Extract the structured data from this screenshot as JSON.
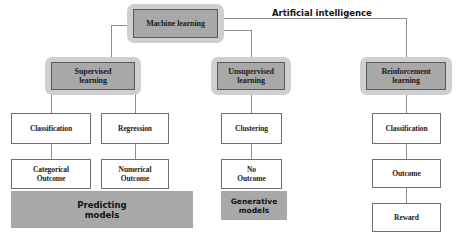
{
  "diagram": {
    "title": "Artificial intelligence",
    "colors": {
      "halo": "#cfcfcf",
      "node_fill": "#a8a8a8",
      "node_border": "#5a5a5a",
      "box_fill": "#ffffff",
      "box_border": "#6e6e6e",
      "line": "#8d8d8d",
      "text": "#1b1b1b",
      "background": "#ffffff"
    },
    "root": {
      "label": "Machine learning"
    },
    "branches": [
      {
        "id": "supervised",
        "label": "Supervised\nlearning",
        "label_line1": "Supervised",
        "label_line2": "learning",
        "banner": "Predicting\nmodels",
        "banner_line1": "Predicting",
        "banner_line2": "models",
        "children": [
          {
            "label": "Classification",
            "outcome_line1": "Categorical",
            "outcome_line2": "Outcome"
          },
          {
            "label": "Regression",
            "outcome_line1": "Numerical",
            "outcome_line2": "Outcome"
          }
        ]
      },
      {
        "id": "unsupervised",
        "label": "Unsupervised\nlearning",
        "label_line1": "Unsupervised",
        "label_line2": "learning",
        "banner": "Generative\nmodels",
        "banner_line1": "Generative",
        "banner_line2": "models",
        "children": [
          {
            "label": "Clustering",
            "outcome_line1": "No",
            "outcome_line2": "Outcome"
          }
        ]
      },
      {
        "id": "reinforcement",
        "label": "Reinforcement\nlearning",
        "label_line1": "Reinforcement",
        "label_line2": "learning",
        "banner": null,
        "children": [
          {
            "label": "Classification",
            "outcome_line1": "Outcome",
            "outcome_line2": "",
            "reward": "Reward"
          }
        ]
      }
    ]
  }
}
